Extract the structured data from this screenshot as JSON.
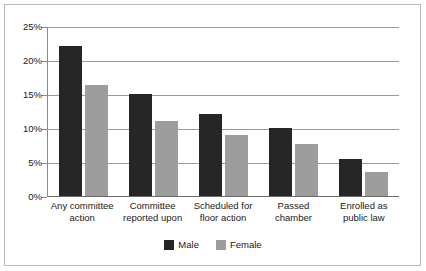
{
  "chart_data": {
    "type": "bar",
    "title": "",
    "subtitle": "",
    "xlabel": "",
    "ylabel": "",
    "ylim": [
      0,
      25
    ],
    "ytick_labels": [
      "25%",
      "20%",
      "15%",
      "10%",
      "5%",
      "0%"
    ],
    "ytick_values": [
      25,
      20,
      15,
      10,
      5,
      0
    ],
    "grid": true,
    "grid_axis": "y",
    "legend_position": "bottom-center",
    "categories": [
      "Any committee action",
      "Committee reported upon",
      "Scheduled for floor action",
      "Passed chamber",
      "Enrolled as public law"
    ],
    "category_lines": [
      [
        "Any committee",
        "action"
      ],
      [
        "Committee",
        "reported upon"
      ],
      [
        "Scheduled for",
        "floor action"
      ],
      [
        "Passed",
        "chamber"
      ],
      [
        "Enrolled as",
        "public law"
      ]
    ],
    "series": [
      {
        "name": "Male",
        "color": "#262626",
        "values": [
          22.0,
          15.0,
          12.0,
          10.0,
          5.4
        ]
      },
      {
        "name": "Female",
        "color": "#9d9d9d",
        "values": [
          16.3,
          11.0,
          8.9,
          7.6,
          3.5
        ]
      }
    ]
  },
  "legend": {
    "items": [
      {
        "label": "Male"
      },
      {
        "label": "Female"
      }
    ]
  },
  "colors": {
    "male": "#262626",
    "female": "#9d9d9d",
    "gridline": "#9a9a9a",
    "axis": "#6e6e6e",
    "frame": "#b9b9b9",
    "background": "#ffffff",
    "text": "#1a1a1a"
  }
}
